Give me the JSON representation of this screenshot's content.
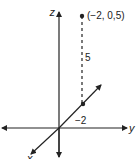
{
  "diagram": {
    "axes": {
      "z_label": "z",
      "y_label": "y",
      "x_label": "x"
    },
    "point": {
      "label": "(−2, 0,5)",
      "coordinates": [
        -2,
        0,
        5
      ]
    },
    "annotations": {
      "height_label": "5",
      "x_offset_label": "−2"
    },
    "colors": {
      "line": "#222222",
      "background": "#ffffff"
    }
  }
}
